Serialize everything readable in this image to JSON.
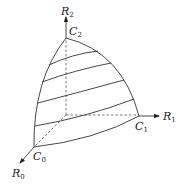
{
  "diagram": {
    "axes": [
      {
        "name": "R_0",
        "base": "R",
        "sub": "0"
      },
      {
        "name": "R_1",
        "base": "R",
        "sub": "1"
      },
      {
        "name": "R_2",
        "base": "R",
        "sub": "2"
      }
    ],
    "corners": [
      {
        "name": "C_0",
        "base": "C",
        "sub": "0"
      },
      {
        "name": "C_1",
        "base": "C",
        "sub": "1"
      },
      {
        "name": "C_2",
        "base": "C",
        "sub": "2"
      }
    ],
    "level_curves_count": 5,
    "colors": {
      "stroke": "#333333",
      "background": "#ffffff"
    }
  }
}
